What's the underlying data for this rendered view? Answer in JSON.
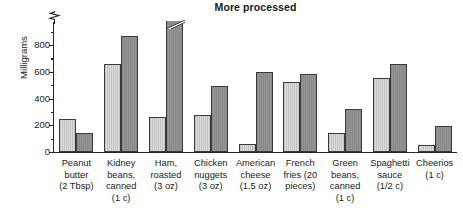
{
  "chart": {
    "title": "More processed",
    "ylabel": "Milligrams"
  },
  "chart_data": {
    "type": "bar",
    "title": "More processed",
    "xlabel": "",
    "ylabel": "Milligrams",
    "ylim": [
      0,
      900
    ],
    "y_axis_break": true,
    "grid": false,
    "legend_position": "none",
    "tick_labels": [
      "0",
      "200",
      "400",
      "600",
      "800"
    ],
    "tick_values": [
      0,
      200,
      400,
      600,
      800
    ],
    "minor_tick_values": [
      100,
      300,
      500,
      700,
      900
    ],
    "categories": [
      "Peanut butter\n(2 Tbsp)",
      "Kidney beans,\ncanned\n(1 c)",
      "Ham, roasted\n(3 oz)",
      "Chicken nuggets\n(3 oz)",
      "American cheese\n(1.5 oz)",
      "French fries (20 pieces)",
      "Green beans,\ncanned\n(1 c)",
      "Spaghetti sauce\n(1/2 c)",
      "Cheerios\n(1 c)"
    ],
    "category_lines": [
      [
        "Peanut",
        "butter",
        "(2 Tbsp)"
      ],
      [
        "Kidney",
        "beans,",
        "canned",
        "(1 c)"
      ],
      [
        "Ham,",
        "roasted",
        "(3 oz)"
      ],
      [
        "Chicken",
        "nuggets",
        "(3 oz)"
      ],
      [
        "American",
        "cheese",
        "(1.5 oz)"
      ],
      [
        "French",
        "fries (20",
        "pieces)"
      ],
      [
        "Green",
        "beans,",
        "canned",
        "(1 c)"
      ],
      [
        "Spaghetti",
        "sauce",
        "(1/2 c)"
      ],
      [
        "Cheerios",
        "(1 c)"
      ]
    ],
    "series": [
      {
        "name": "light",
        "color": "#cccccc",
        "values": [
          250,
          655,
          265,
          275,
          60,
          520,
          140,
          550,
          55
        ]
      },
      {
        "name": "dark",
        "color": "#8d8d8d",
        "values": [
          140,
          870,
          1020,
          490,
          595,
          580,
          320,
          655,
          195
        ],
        "clipped": [
          false,
          false,
          true,
          false,
          false,
          false,
          false,
          false,
          false
        ]
      }
    ]
  }
}
